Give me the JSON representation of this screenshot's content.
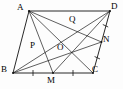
{
  "figure": {
    "kind": "geometry-diagram",
    "shape": "parallelogram",
    "name": "parallelogram-abcd-with-medians",
    "stroke_color": "#111111",
    "background_color": "#fdfdfd",
    "width": 123,
    "height": 89
  },
  "labels": {
    "a": "A",
    "b": "B",
    "c": "C",
    "d": "D",
    "m": "M",
    "n": "N",
    "o": "O",
    "p": "P",
    "q": "Q"
  },
  "points": [
    {
      "id": "A",
      "label": "A",
      "x": 29,
      "y": 11,
      "role": "vertex",
      "label_x": 17,
      "label_y": 4
    },
    {
      "id": "D",
      "label": "D",
      "x": 110,
      "y": 11,
      "role": "vertex",
      "label_x": 112,
      "label_y": 3
    },
    {
      "id": "B",
      "label": "B",
      "x": 13,
      "y": 73,
      "role": "vertex",
      "label_x": 2,
      "label_y": 66
    },
    {
      "id": "C",
      "label": "C",
      "x": 93,
      "y": 73,
      "role": "vertex",
      "label_x": 92,
      "label_y": 66
    },
    {
      "id": "M",
      "label": "M",
      "x": 53,
      "y": 73,
      "role": "midpoint-of-BC",
      "label_x": 47,
      "label_y": 77
    },
    {
      "id": "N",
      "label": "N",
      "x": 101.5,
      "y": 42,
      "role": "midpoint-of-DC",
      "label_x": 103,
      "label_y": 36
    },
    {
      "id": "O",
      "label": "O",
      "x": 61.5,
      "y": 42,
      "role": "intersection-diagonals",
      "label_x": 58,
      "label_y": 44
    },
    {
      "id": "P",
      "label": "P",
      "x": 41,
      "y": 49,
      "role": "intersection-BD-AM",
      "label_x": 31,
      "label_y": 42
    },
    {
      "id": "Q",
      "label": "Q",
      "x": 73,
      "y": 30,
      "role": "intersection-BD-AN",
      "label_x": 70,
      "label_y": 16
    }
  ],
  "segments": [
    {
      "id": "AB",
      "from": "A",
      "to": "B",
      "kind": "side"
    },
    {
      "id": "BC",
      "from": "B",
      "to": "C",
      "kind": "side"
    },
    {
      "id": "CD",
      "from": "C",
      "to": "D",
      "kind": "side"
    },
    {
      "id": "DA",
      "from": "D",
      "to": "A",
      "kind": "side"
    },
    {
      "id": "AC",
      "from": "A",
      "to": "C",
      "kind": "diagonal"
    },
    {
      "id": "BD",
      "from": "B",
      "to": "D",
      "kind": "diagonal"
    },
    {
      "id": "AM",
      "from": "A",
      "to": "M",
      "kind": "cevian"
    },
    {
      "id": "AN",
      "from": "A",
      "to": "N",
      "kind": "cevian"
    },
    {
      "id": "BN",
      "from": "B",
      "to": "N",
      "kind": "cevian"
    },
    {
      "id": "MD",
      "from": "M",
      "to": "D",
      "kind": "cevian"
    }
  ],
  "tick_marks": [
    {
      "id": "tick-BM",
      "segment": "BM",
      "count": 1,
      "meaning": "BM equals MC"
    },
    {
      "id": "tick-MC",
      "segment": "MC",
      "count": 1,
      "meaning": "BM equals MC"
    },
    {
      "id": "tick-DN",
      "segment": "DN",
      "count": 1,
      "meaning": "DN equals NC"
    },
    {
      "id": "tick-NC",
      "segment": "NC",
      "count": 1,
      "meaning": "DN equals NC"
    }
  ]
}
